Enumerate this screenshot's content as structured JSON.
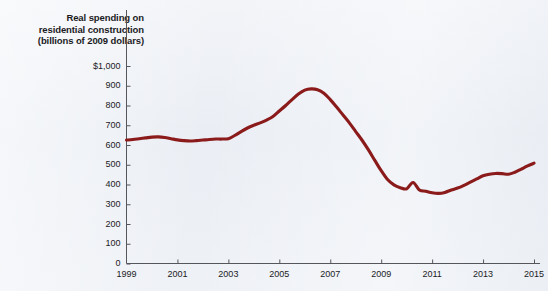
{
  "figure": {
    "title_lines": [
      "Real spending on",
      "residential construction",
      "(billions of 2009 dollars)"
    ],
    "line_color": "#8B1A1A",
    "axis_color": "#55555c",
    "background_color": "#eef1f6"
  },
  "chart_data": {
    "type": "line",
    "title": "Real spending on residential construction (billions of 2009 dollars)",
    "xlabel": "",
    "ylabel": "Real spending on residential construction (billions of 2009 dollars)",
    "xlim": [
      1999,
      2015
    ],
    "ylim": [
      0,
      1000
    ],
    "grid": false,
    "legend": "none",
    "ytick_labels": [
      "$1,000",
      "900",
      "800",
      "700",
      "600",
      "500",
      "400",
      "300",
      "200",
      "100",
      "0"
    ],
    "ytick_values": [
      1000,
      900,
      800,
      700,
      600,
      500,
      400,
      300,
      200,
      100,
      0
    ],
    "xtick_labels": [
      "1999",
      "2001",
      "2003",
      "2005",
      "2007",
      "2009",
      "2011",
      "2013",
      "2015"
    ],
    "xtick_values": [
      1999,
      2001,
      2003,
      2005,
      2007,
      2009,
      2011,
      2013,
      2015
    ],
    "series": [
      {
        "name": "Real residential construction spending",
        "x": [
          1999.0,
          1999.25,
          1999.5,
          1999.75,
          2000.0,
          2000.25,
          2000.5,
          2000.75,
          2001.0,
          2001.25,
          2001.5,
          2001.75,
          2002.0,
          2002.25,
          2002.5,
          2002.75,
          2003.0,
          2003.25,
          2003.5,
          2003.75,
          2004.0,
          2004.25,
          2004.5,
          2004.75,
          2005.0,
          2005.25,
          2005.5,
          2005.75,
          2006.0,
          2006.25,
          2006.5,
          2006.75,
          2007.0,
          2007.25,
          2007.5,
          2007.75,
          2008.0,
          2008.25,
          2008.5,
          2008.75,
          2009.0,
          2009.25,
          2009.5,
          2009.75,
          2010.0,
          2010.25,
          2010.5,
          2010.75,
          2011.0,
          2011.25,
          2011.5,
          2011.75,
          2012.0,
          2012.25,
          2012.5,
          2012.75,
          2013.0,
          2013.25,
          2013.5,
          2013.75,
          2014.0,
          2014.25,
          2014.5,
          2014.75,
          2015.0
        ],
        "values": [
          625,
          628,
          632,
          636,
          640,
          641,
          638,
          632,
          626,
          622,
          620,
          622,
          625,
          628,
          630,
          630,
          632,
          648,
          668,
          686,
          700,
          712,
          726,
          744,
          772,
          800,
          830,
          858,
          878,
          884,
          880,
          862,
          830,
          792,
          752,
          712,
          668,
          624,
          575,
          522,
          470,
          425,
          398,
          384,
          378,
          410,
          372,
          366,
          358,
          355,
          360,
          372,
          382,
          396,
          412,
          428,
          444,
          452,
          456,
          455,
          452,
          462,
          478,
          494,
          508
        ]
      }
    ],
    "annotations": [
      {
        "text": "peak",
        "x": 2006.25,
        "y": 884
      },
      {
        "text": "trough",
        "x": 2011.25,
        "y": 355
      }
    ]
  }
}
